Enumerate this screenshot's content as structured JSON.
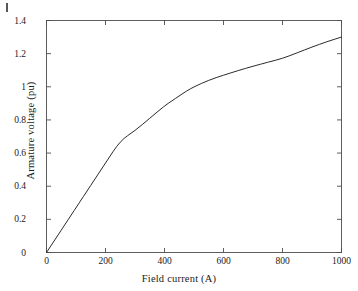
{
  "figure": {
    "background_color": "#ffffff",
    "axis_color": "#4d4d4d",
    "line_color": "#2b2b2b",
    "artifact_name": "scan-mark"
  },
  "chart_data": {
    "type": "line",
    "title": "",
    "xlabel": "Field current (A)",
    "ylabel": "Armature voltage (pu)",
    "xlim": [
      0,
      1000
    ],
    "ylim": [
      0,
      1.4
    ],
    "xticks": [
      0,
      200,
      400,
      600,
      800,
      1000
    ],
    "yticks": [
      0,
      0.2,
      0.4,
      0.6,
      0.8,
      1,
      1.2,
      1.4
    ],
    "xticklabels": [
      "0",
      "200",
      "400",
      "600",
      "800",
      "1000"
    ],
    "yticklabels": [
      "0",
      "0.2",
      "0.4",
      "0.6",
      "0.8",
      "1",
      "1.2",
      "1.4"
    ],
    "grid": false,
    "legend": null,
    "series": [
      {
        "name": "Open-circuit saturation characteristic",
        "x": [
          0,
          50,
          100,
          150,
          200,
          250,
          300,
          350,
          400,
          425,
          450,
          475,
          500,
          550,
          600,
          650,
          700,
          750,
          800,
          850,
          900,
          950,
          1000
        ],
        "y": [
          0,
          0.135,
          0.27,
          0.405,
          0.54,
          0.675,
          0.735,
          0.81,
          0.885,
          0.915,
          0.945,
          0.975,
          1.0,
          1.04,
          1.07,
          1.098,
          1.124,
          1.148,
          1.171,
          1.205,
          1.24,
          1.272,
          1.3
        ]
      }
    ]
  }
}
